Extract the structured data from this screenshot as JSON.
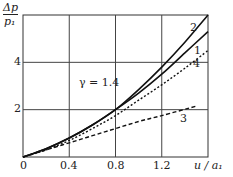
{
  "chart_data": {
    "type": "line",
    "title": "",
    "xlabel": "u / a1",
    "ylabel": "Δp / p1",
    "xlim": [
      0,
      1.6
    ],
    "ylim": [
      0,
      6
    ],
    "grid": true,
    "x_ticks": [
      "0",
      "0.4",
      "0.8",
      "1.2"
    ],
    "y_ticks": [
      "2",
      "4"
    ],
    "annotation": "γ = 1.4",
    "series": [
      {
        "name": "1",
        "style": "solid",
        "x": [
          0,
          0.2,
          0.4,
          0.6,
          0.8,
          1.0,
          1.2,
          1.4,
          1.6
        ],
        "values": [
          0,
          0.35,
          0.8,
          1.35,
          2.0,
          2.7,
          3.5,
          4.4,
          5.3
        ]
      },
      {
        "name": "2",
        "style": "solid",
        "x": [
          0,
          0.2,
          0.4,
          0.6,
          0.8,
          1.0,
          1.2,
          1.4,
          1.6
        ],
        "values": [
          0,
          0.35,
          0.8,
          1.35,
          2.0,
          2.85,
          3.8,
          4.85,
          6.0
        ]
      },
      {
        "name": "3",
        "style": "dashed",
        "x": [
          0,
          0.2,
          0.4,
          0.6,
          0.8,
          1.0,
          1.2,
          1.5
        ],
        "values": [
          0,
          0.3,
          0.6,
          0.9,
          1.2,
          1.5,
          1.75,
          2.15
        ]
      },
      {
        "name": "4",
        "style": "dotted",
        "x": [
          0,
          0.2,
          0.4,
          0.6,
          0.8,
          1.0,
          1.2,
          1.4,
          1.6
        ],
        "values": [
          0,
          0.3,
          0.7,
          1.2,
          1.75,
          2.4,
          3.05,
          3.75,
          4.5
        ]
      }
    ]
  },
  "labels": {
    "y_axis_num": "Δp",
    "y_axis_den": "p₁",
    "x_axis": "u / a₁",
    "gamma": "γ = 1.4",
    "curve1": "1",
    "curve2": "2",
    "curve3": "3",
    "curve4": "4",
    "tick_x0": "0",
    "tick_x1": "0.4",
    "tick_x2": "0.8",
    "tick_x3": "1.2",
    "tick_y2": "2",
    "tick_y4": "4"
  }
}
